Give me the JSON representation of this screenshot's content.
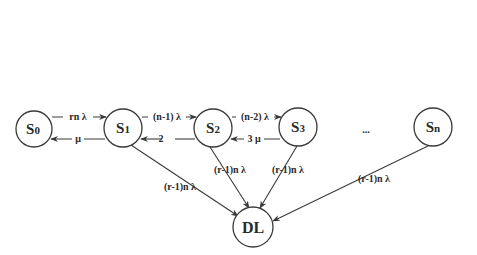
{
  "diagram": {
    "type": "state-transition (Markov chain)",
    "colors": {
      "stroke": "#3a3a3a",
      "text": "#2a2a2a",
      "background": "#ffffff"
    },
    "nodes": [
      {
        "id": "S0",
        "label": "S",
        "sub": "0"
      },
      {
        "id": "S1",
        "label": "S",
        "sub": "1"
      },
      {
        "id": "S2",
        "label": "S",
        "sub": "2"
      },
      {
        "id": "S3",
        "label": "S",
        "sub": "3"
      },
      {
        "id": "Sn",
        "label": "S",
        "sub": "n"
      },
      {
        "id": "DL",
        "label": "DL",
        "sub": ""
      }
    ],
    "ellipsis": "...",
    "edges": [
      {
        "from": "S0",
        "to": "S1",
        "label": "rn λ"
      },
      {
        "from": "S1",
        "to": "S0",
        "label": "μ"
      },
      {
        "from": "S1",
        "to": "S2",
        "label": "(n-1) λ"
      },
      {
        "from": "S2",
        "to": "S1",
        "label": "2"
      },
      {
        "from": "S2",
        "to": "S3",
        "label": "(n-2) λ"
      },
      {
        "from": "S3",
        "to": "S2",
        "label": "3 μ"
      },
      {
        "from": "S1",
        "to": "DL",
        "label": "(r-1)n λ"
      },
      {
        "from": "S2",
        "to": "DL",
        "label": "(r-1)n λ"
      },
      {
        "from": "S3",
        "to": "DL",
        "label": "(r-1)n λ"
      },
      {
        "from": "Sn",
        "to": "DL",
        "label": "(r-1)n λ"
      }
    ]
  }
}
